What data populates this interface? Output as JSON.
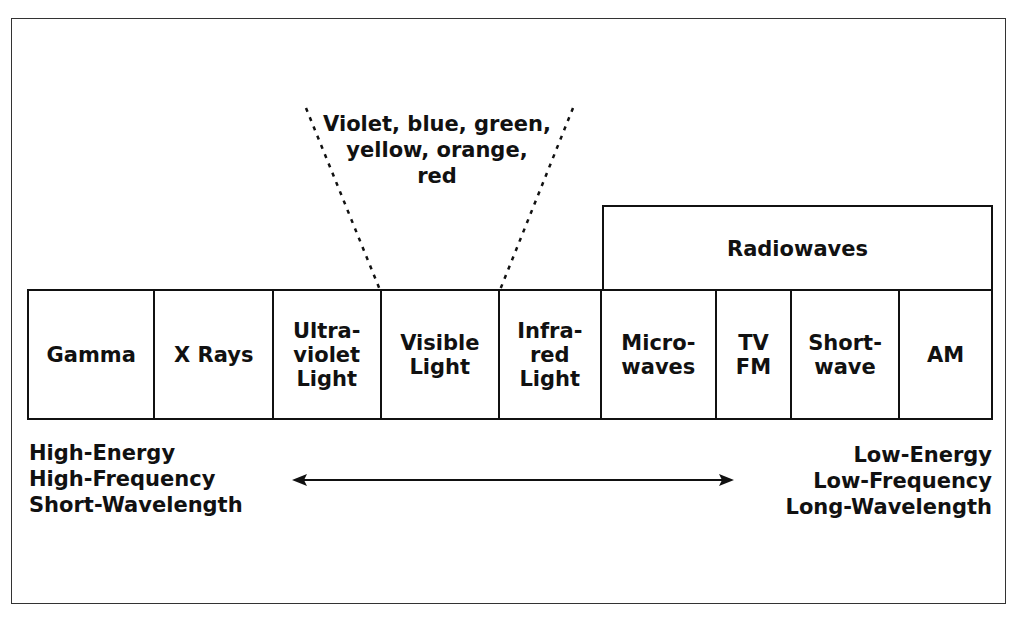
{
  "diagram": {
    "title_region": "Electromagnetic spectrum",
    "visible_colors_label": "Violet, blue, green,\nyellow, orange,\nred",
    "radiowaves_label": "Radiowaves",
    "bands": [
      {
        "label": "Gamma",
        "width": 127
      },
      {
        "label": "X Rays",
        "width": 119
      },
      {
        "label": "Ultra-\nviolet\nLight",
        "width": 108
      },
      {
        "label": "Visible\nLight",
        "width": 119
      },
      {
        "label": "Infra-\nred\nLight",
        "width": 102
      },
      {
        "label": "Micro-\nwaves",
        "width": 116
      },
      {
        "label": "TV\nFM",
        "width": 75
      },
      {
        "label": "Short-\nwave",
        "width": 109
      },
      {
        "label": "AM",
        "width": 91
      }
    ],
    "left_labels": "High-Energy\nHigh-Frequency\nShort-Wavelength",
    "right_labels": "Low-Energy\nLow-Frequency\nLong-Wavelength",
    "arrow": {
      "direction": "bidirectional"
    }
  }
}
